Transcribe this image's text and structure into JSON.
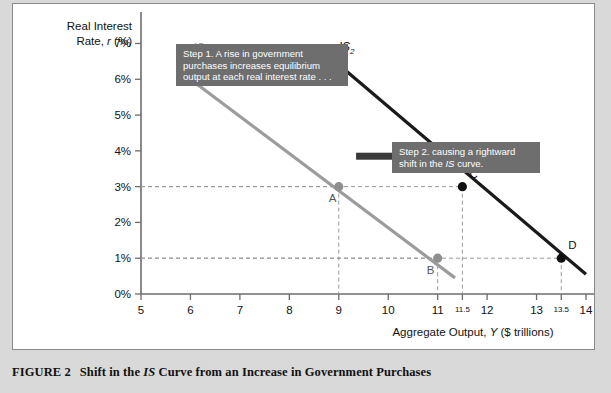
{
  "figure": {
    "caption_number": "FIGURE 2",
    "caption_text_before": "Shift in the ",
    "caption_italic": "IS",
    "caption_text_after": " Curve from an Increase in Government Purchases"
  },
  "callouts": [
    {
      "name": "step-1",
      "lines": [
        "Step 1. A rise in government",
        "purchases increases equilibrium",
        "output at each real interest rate . . ."
      ]
    },
    {
      "name": "step-2",
      "lines": [
        "Step 2. causing a rightward",
        "shift in the IS curve."
      ]
    }
  ],
  "chart_data": {
    "type": "line",
    "title": "Shift in the IS Curve from an Increase in Government Purchases",
    "xlabel": "Aggregate Output, Y ($ trillions)",
    "ylabel": "Real Interest Rate, r (%)",
    "ylabel_line1": "Real Interest",
    "ylabel_line2_a": "Rate, ",
    "ylabel_line2_italic": "r",
    "ylabel_line2_b": " (%)",
    "xlim": [
      5,
      14
    ],
    "ylim": [
      0,
      7.6
    ],
    "grid": false,
    "legend": "inline-labels",
    "xticks": [
      5,
      6,
      7,
      8,
      9,
      10,
      11,
      11.5,
      12,
      13,
      13.5,
      14
    ],
    "xticklabels": [
      "5",
      "6",
      "7",
      "8",
      "9",
      "10",
      "11",
      "11.5",
      "12",
      "13",
      "13.5",
      "14"
    ],
    "xtick_small": [
      false,
      false,
      false,
      false,
      false,
      false,
      false,
      true,
      false,
      false,
      true,
      false
    ],
    "yticks": [
      0,
      1,
      2,
      3,
      4,
      5,
      6,
      7
    ],
    "yticklabels": [
      "0%",
      "1%",
      "2%",
      "3%",
      "4%",
      "5%",
      "6%",
      "7%"
    ],
    "series": [
      {
        "name": "IS1",
        "label": "IS",
        "label_sub": "1",
        "color": "#9c9c9c",
        "x": [
          6,
          11.35
        ],
        "y": [
          6,
          0.45
        ],
        "label_x": 6.05,
        "label_y": 6.75
      },
      {
        "name": "IS2",
        "label": "IS",
        "label_sub": "2",
        "color": "#1a1a1a",
        "x": [
          9.05,
          14.0
        ],
        "y": [
          6.35,
          0.55
        ],
        "label_x": 9.0,
        "label_y": 6.8
      }
    ],
    "points": [
      {
        "label": "A",
        "x": 9,
        "y": 3,
        "color": "#8f8f8f",
        "label_dx": -10,
        "label_dy": 15
      },
      {
        "label": "B",
        "x": 11,
        "y": 1,
        "color": "#8f8f8f",
        "label_dx": -11,
        "label_dy": 16
      },
      {
        "label": "C",
        "x": 11.5,
        "y": 3,
        "color": "#111111",
        "label_dx": 7,
        "label_dy": -9
      },
      {
        "label": "D",
        "x": 13.5,
        "y": 1,
        "color": "#111111",
        "label_dx": 7,
        "label_dy": -9
      }
    ],
    "annotations": [
      {
        "type": "arrow",
        "name": "shift-arrow",
        "x1": 9.35,
        "y1": 3.85,
        "x2": 11.85,
        "y2": 3.85
      }
    ]
  }
}
